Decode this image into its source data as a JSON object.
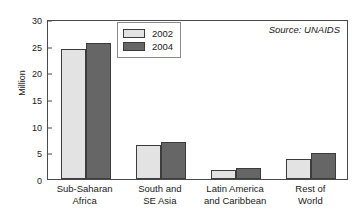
{
  "chart_data": {
    "type": "bar",
    "title": "",
    "xlabel": "",
    "ylabel": "Million",
    "ylim": [
      0,
      30
    ],
    "yticks": [
      0,
      5,
      10,
      15,
      20,
      25,
      30
    ],
    "ytick_labels": [
      "0",
      "5",
      "10",
      "15",
      "20",
      "25",
      "30"
    ],
    "grid": false,
    "legend_position": "top-left inside plot area",
    "categories": [
      "Sub-Saharan\nAfrica",
      "South and\nSE Asia",
      "Latin America\nand Caribbean",
      "Rest of\nWorld"
    ],
    "category_lines": [
      [
        "Sub-Saharan",
        "Africa"
      ],
      [
        "South and",
        "SE Asia"
      ],
      [
        "Latin America",
        "and Caribbean"
      ],
      [
        "Rest of",
        "World"
      ]
    ],
    "series": [
      {
        "name": "2002",
        "color": "#e3e3e3",
        "values": [
          24.4,
          6.3,
          1.7,
          3.7
        ]
      },
      {
        "name": "2004",
        "color": "#666666",
        "values": [
          25.5,
          7.0,
          2.1,
          4.9
        ]
      }
    ],
    "annotations": [
      {
        "text": "Source: UNAIDS",
        "position": "top-right",
        "style": "italic"
      }
    ]
  },
  "legend": {
    "entries": [
      {
        "label": "2002"
      },
      {
        "label": "2004"
      }
    ]
  },
  "annotation": {
    "source": "Source: UNAIDS"
  },
  "colors": {
    "series_2002": "#e3e3e3",
    "series_2004": "#666666",
    "axis": "#4a4a4a",
    "text": "#1a1a1a",
    "background": "#ffffff"
  }
}
